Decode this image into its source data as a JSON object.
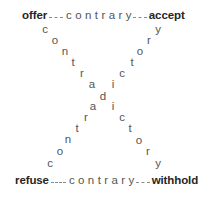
{
  "diagram": {
    "corners": {
      "top_left": "offer",
      "top_right": "accept",
      "bottom_left": "refuse",
      "bottom_right": "withhold"
    },
    "top_relation": "contrary",
    "bottom_relation": "contrary",
    "diagonals": {
      "offer_to_withhold": {
        "label": "contradictory",
        "letters": [
          {
            "ch": "c",
            "x": 45,
            "y": 30
          },
          {
            "ch": "o",
            "x": 55,
            "y": 41
          },
          {
            "ch": "n",
            "x": 65,
            "y": 52
          },
          {
            "ch": "t",
            "x": 73,
            "y": 63
          },
          {
            "ch": "r",
            "x": 82,
            "y": 74
          },
          {
            "ch": "a",
            "x": 92,
            "y": 85
          },
          {
            "ch": "d",
            "x": 103,
            "y": 97
          },
          {
            "ch": "i",
            "x": 113,
            "y": 107
          },
          {
            "ch": "c",
            "x": 122,
            "y": 118
          },
          {
            "ch": "t",
            "x": 130,
            "y": 129
          },
          {
            "ch": "o",
            "x": 139,
            "y": 141
          },
          {
            "ch": "r",
            "x": 148,
            "y": 152
          },
          {
            "ch": "y",
            "x": 158,
            "y": 164
          }
        ]
      },
      "refuse_to_accept": {
        "label": "contradictory",
        "letters": [
          {
            "ch": "c",
            "x": 50,
            "y": 164
          },
          {
            "ch": "o",
            "x": 60,
            "y": 152
          },
          {
            "ch": "n",
            "x": 68,
            "y": 140
          },
          {
            "ch": "t",
            "x": 77,
            "y": 129
          },
          {
            "ch": "r",
            "x": 86,
            "y": 118
          },
          {
            "ch": "a",
            "x": 93,
            "y": 107
          },
          {
            "ch": "i",
            "x": 113,
            "y": 85
          },
          {
            "ch": "c",
            "x": 122,
            "y": 74
          },
          {
            "ch": "t",
            "x": 132,
            "y": 63
          },
          {
            "ch": "o",
            "x": 140,
            "y": 52
          },
          {
            "ch": "r",
            "x": 149,
            "y": 41
          },
          {
            "ch": "y",
            "x": 158,
            "y": 30
          }
        ]
      }
    }
  }
}
